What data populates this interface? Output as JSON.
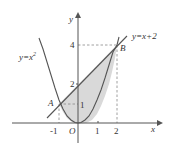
{
  "figure": {
    "type": "math-diagram",
    "axes": {
      "x_label": "x",
      "y_label": "y",
      "origin_label": "O",
      "x_ticks": [
        "-1",
        "1",
        "2"
      ],
      "y_ticks": [
        "1",
        "2",
        "4"
      ]
    },
    "curves": [
      {
        "name": "parabola",
        "label": "y=x",
        "label_sup": "2",
        "equation": "y=x^2"
      },
      {
        "name": "line",
        "label": "y=x+2",
        "equation": "y=x+2"
      }
    ],
    "points": [
      {
        "label": "A",
        "x": -1,
        "y": 1
      },
      {
        "label": "B",
        "x": 2,
        "y": 4
      }
    ],
    "shaded_region": "between y=x+2 and y=x^2 for -1<=x<=2",
    "colors": {
      "stroke": "#555555",
      "shade": "#d9d9d9",
      "dashed": "#888888"
    }
  }
}
